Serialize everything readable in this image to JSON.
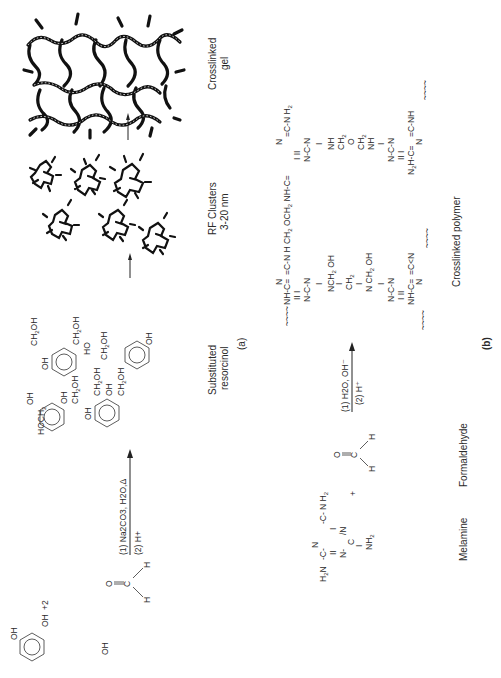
{
  "figure": {
    "orientation": "rotated-90-ccw",
    "panel_a": {
      "label": "(a)",
      "reactant_1": {
        "name": "resorcinol",
        "groups": [
          "OH",
          "OH"
        ]
      },
      "coefficient": "+2",
      "reactant_2": {
        "atoms": [
          "O",
          "C",
          "H",
          "H"
        ]
      },
      "conditions": {
        "step1": "(1) Na2CO3, H2O,Δ",
        "step2": "(2) H+"
      },
      "product_groups": [
        "HOCH2",
        "OH",
        "CH2OH",
        "OH",
        "CH2OH",
        "OH",
        "CH2OH",
        "OH",
        "CH2OH",
        "HO",
        "CH2OH",
        "OH"
      ],
      "product_label_line1": "Substituted",
      "product_label_line2": "resorcinol",
      "clusters_label_line1": "RF Clusters",
      "clusters_label_line2": "3-20 nm",
      "gel_label_line1": "Crosslinked",
      "gel_label_line2": "gel"
    },
    "panel_b": {
      "label": "(b)",
      "reactant_1_label": "Melamine",
      "reactant_1_groups": [
        "H2N",
        "N H2",
        "NH2"
      ],
      "plus": "+",
      "reactant_2_label": "Formaldehyde",
      "reactant_2_atoms": [
        "O",
        "C",
        "H",
        "H"
      ],
      "conditions": {
        "step1": "(1) H2O, OH⁻",
        "step2": "(2) H⁺"
      },
      "product_label": "Crosslinked polymer",
      "product_groups": [
        "NH",
        "N H CH2 OCH2",
        "NH",
        "N H2",
        "NCH2 OH",
        "CH2",
        "N CH2 OH",
        "NH",
        "CH2",
        "O",
        "CH2",
        "NH",
        "N2H",
        "NH",
        "N"
      ]
    }
  }
}
